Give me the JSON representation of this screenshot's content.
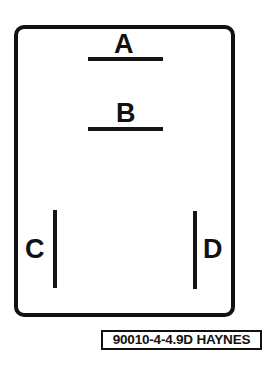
{
  "diagram": {
    "title": "",
    "type": "component outline with terminal markings",
    "outline": {
      "shape": "rounded-rectangle"
    },
    "terminals": [
      {
        "id": "A",
        "label": "A",
        "orientation": "horizontal",
        "position": "top"
      },
      {
        "id": "B",
        "label": "B",
        "orientation": "horizontal",
        "position": "upper-middle"
      },
      {
        "id": "C",
        "label": "C",
        "orientation": "vertical",
        "position": "lower-left"
      },
      {
        "id": "D",
        "label": "D",
        "orientation": "vertical",
        "position": "lower-right"
      }
    ],
    "figure_code": "90010-4-4.9D HAYNES"
  },
  "colors": {
    "ink": "#111111",
    "background": "#ffffff"
  }
}
